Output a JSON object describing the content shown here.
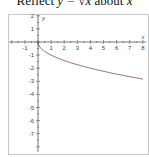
{
  "title": {
    "prefix": "Reflect ",
    "eq": "y = √x",
    "suffix": " about ",
    "var": "x"
  },
  "chart_data": {
    "type": "line",
    "title": "Reflect y = √x about x",
    "xlabel": "x",
    "ylabel": "y",
    "xlim": [
      -2,
      8
    ],
    "ylim": [
      -8,
      2
    ],
    "x_ticks": [
      -1,
      1,
      2,
      3,
      4,
      5,
      6,
      7,
      8
    ],
    "y_ticks": [
      2,
      1,
      -1,
      -2,
      -3,
      -4,
      -5,
      -6,
      -7
    ],
    "grid": false,
    "series": [
      {
        "name": "y = -√x",
        "color": "#7a4a5a",
        "x": [
          0,
          0.25,
          0.5,
          1,
          2,
          3,
          4,
          5,
          6,
          7,
          8
        ],
        "y": [
          0,
          -0.5,
          -0.71,
          -1,
          -1.41,
          -1.73,
          -2,
          -2.24,
          -2.45,
          -2.65,
          -2.83
        ]
      }
    ]
  }
}
